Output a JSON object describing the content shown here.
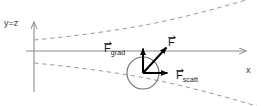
{
  "figure": {
    "background_color": "#ffffff",
    "axes": {
      "vertical_label": "y=z",
      "horizontal_label": "x",
      "axis_color": "#8c8c8c",
      "origin_x": 34,
      "origin_y": 51
    },
    "beam": {
      "name": "gaussian-beam-envelope",
      "style": "dashed",
      "color": "#9a9a9a",
      "waist_position_x": 34,
      "upper_curve_points": "34,40 70,36 110,31 150,24 190,14 230,4 262,-4",
      "lower_curve_points": "34,63 70,67 110,72 150,79 190,89 230,99 262,107"
    },
    "particle": {
      "name": "trapped-sphere",
      "center_x": 143,
      "center_y": 73,
      "radius": 16,
      "stroke_color": "#6f6f6f",
      "fill": "none"
    },
    "vectors": [
      {
        "id": "f-grad",
        "label": "F",
        "subscript": "grad",
        "color": "#000000",
        "from_x": 143,
        "from_y": 73,
        "to_x": 143,
        "to_y": 46,
        "direction": "up"
      },
      {
        "id": "f-scatt",
        "label": "F",
        "subscript": "scatt",
        "color": "#000000",
        "from_x": 143,
        "from_y": 73,
        "to_x": 170,
        "to_y": 73,
        "direction": "right"
      },
      {
        "id": "f-resultant",
        "label": "F",
        "subscript": "",
        "color": "#000000",
        "from_x": 143,
        "from_y": 73,
        "to_x": 169,
        "to_y": 45,
        "direction": "up-right"
      }
    ],
    "labels": {
      "y_axis": "y=z",
      "x_axis": "x",
      "f_grad_symbol": "F",
      "f_grad_subscript": "grad",
      "f_resultant_symbol": "F",
      "f_scatt_symbol": "F",
      "f_scatt_subscript": "scatt"
    }
  }
}
